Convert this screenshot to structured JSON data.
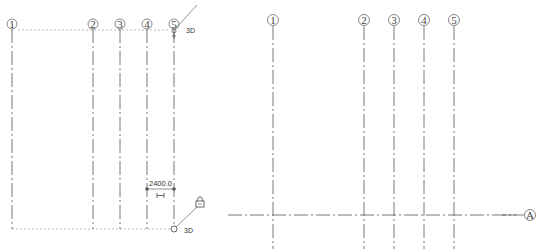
{
  "left_view": {
    "grids": [
      {
        "label": "1",
        "x": 12
      },
      {
        "label": "2",
        "x": 93
      },
      {
        "label": "3",
        "x": 120
      },
      {
        "label": "4",
        "x": 147
      },
      {
        "label": "5",
        "x": 174
      }
    ],
    "top_extent_label": "3D",
    "bottom_extent_label": "3D",
    "dimension": {
      "value": "2400.0",
      "from_grid": "4",
      "to_grid": "5"
    },
    "icons": [
      "lock-icon",
      "dimension-toggle-icon",
      "grip-handle-icon"
    ]
  },
  "right_view": {
    "vertical_grids": [
      {
        "label": "1",
        "x": 53
      },
      {
        "label": "2",
        "x": 144
      },
      {
        "label": "3",
        "x": 174
      },
      {
        "label": "4",
        "x": 204
      },
      {
        "label": "5",
        "x": 234
      }
    ],
    "horizontal_grids": [
      {
        "label": "A",
        "y": 215
      }
    ]
  },
  "colors": {
    "line": "#555555",
    "dashed_extent": "#aaaaaa",
    "background": "#ffffff"
  }
}
